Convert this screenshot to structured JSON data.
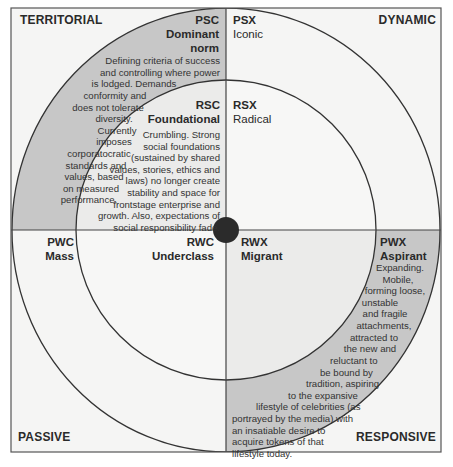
{
  "colors": {
    "background": "#f5f5f4",
    "outer_ring_shade": "#c7c7c7",
    "inner_shade": "#ebebea",
    "line": "#333333",
    "center_dot": "#2b2b2b"
  },
  "corners": {
    "top_left": "TERRITORIAL",
    "top_right": "DYNAMIC",
    "bottom_left": "PASSIVE",
    "bottom_right": "RESPONSIVE"
  },
  "segments": {
    "psc": {
      "code": "PSC",
      "name_line1": "Dominant",
      "name_line2": "norm",
      "desc": [
        "Defining criteria of success",
        "and controlling where power",
        "is lodged. Demands",
        "conformity and",
        "does not tolerate",
        "diversity.",
        "Currently",
        "imposes",
        "corporatocratic",
        "standards and",
        "values, based",
        "on measured",
        "performance."
      ]
    },
    "psx": {
      "code": "PSX",
      "name": "Iconic"
    },
    "rsc": {
      "code": "RSC",
      "name": "Foundational",
      "desc": [
        "Crumbling. Strong",
        "social foundations",
        "(sustained by shared",
        "values, stories, ethics and",
        "laws) no longer create",
        "stability and space for",
        "frontstage enterprise and",
        "growth. Also, expectations of",
        "social responsibility fade."
      ]
    },
    "rsx": {
      "code": "RSX",
      "name": "Radical"
    },
    "pwc": {
      "code": "PWC",
      "name": "Mass"
    },
    "rwc": {
      "code": "RWC",
      "name": "Underclass"
    },
    "rwx": {
      "code": "RWX",
      "name": "Migrant"
    },
    "pwx": {
      "code": "PWX",
      "name": "Aspirant",
      "desc": [
        "Expanding.",
        "Mobile,",
        "forming loose,",
        "unstable",
        "and fragile",
        "attachments,",
        "attracted to",
        "the new and",
        "reluctant to",
        "be bound by",
        "tradition, aspiring",
        "to the expansive",
        "lifestyle of celebrities (as",
        "portrayed by the media) with",
        "an insatiable desire to",
        "acquire tokens of that",
        "lifestyle today."
      ]
    }
  }
}
